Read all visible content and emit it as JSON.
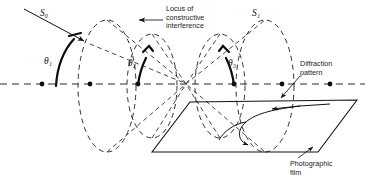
{
  "figure": {
    "title_alt": "Diffraction cones from a row of scatterers",
    "labels": {
      "incident_beam": "S₀",
      "diffracted_beam": "S₁",
      "angle_1": "θ₁",
      "angle_2": "θ₂",
      "angle_3": "θ₃",
      "locus_1": "Locus of",
      "locus_2": "constructive",
      "locus_3": "interference",
      "diffraction_1": "Diffraction",
      "diffraction_2": "pattern",
      "film_1": "Photographic",
      "film_2": "film"
    },
    "colors": {
      "background": "#ffffff",
      "ink": "#111111",
      "dashed": "#303030"
    },
    "geometry": {
      "axis_y": 84,
      "scatterer_x": [
        42,
        90,
        138,
        186,
        234,
        282,
        330
      ],
      "apex": [
        186,
        84
      ],
      "cone_rims": [
        {
          "cx": 107,
          "cy": 86,
          "rx": 29,
          "ry": 66
        },
        {
          "cx": 152,
          "cy": 86,
          "rx": 25,
          "ry": 52
        },
        {
          "cx": 220,
          "cy": 86,
          "rx": 25,
          "ry": 52
        },
        {
          "cx": 265,
          "cy": 86,
          "rx": 29,
          "ry": 66
        }
      ],
      "film_corners": [
        [
          190,
          102
        ],
        [
          357,
          100
        ],
        [
          318,
          152
        ],
        [
          152,
          152
        ]
      ]
    }
  }
}
